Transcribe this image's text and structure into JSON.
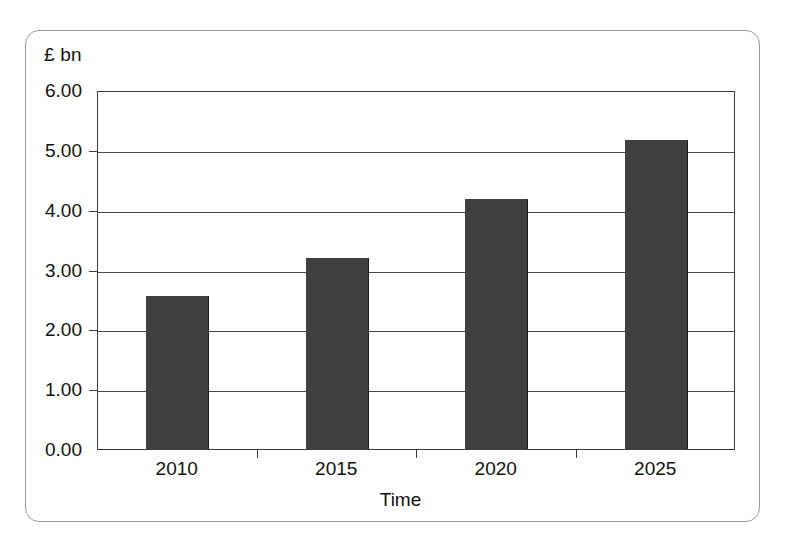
{
  "chart_data": {
    "type": "bar",
    "title": "",
    "subtitle": "",
    "categories": [
      "2010",
      "2015",
      "2020",
      "2025"
    ],
    "values": [
      2.55,
      3.2,
      4.18,
      5.17
    ],
    "series": [
      {
        "name": "",
        "values": [
          2.55,
          3.2,
          4.18,
          5.17
        ]
      }
    ],
    "xlabel": "Time",
    "ylabel": "£ bn",
    "ylim": [
      0,
      6
    ],
    "ytick_step": 1,
    "ytick_labels": [
      "6.00",
      "5.00",
      "4.00",
      "3.00",
      "2.00",
      "1.00",
      "0.00"
    ],
    "ytick_values": [
      6,
      5,
      4,
      3,
      2,
      1,
      0
    ],
    "grid": {
      "horizontal": true,
      "vertical": false
    },
    "legend": {
      "visible": false,
      "position": "none"
    },
    "bar_color": "#404040",
    "axis_color": "#3b3b3b",
    "grid_color": "#4a4a4a",
    "frame_color": "#9a9a9a",
    "background_color": "#ffffff"
  },
  "axes": {
    "y_unit_caption": "£ bn",
    "x_title": "Time"
  }
}
